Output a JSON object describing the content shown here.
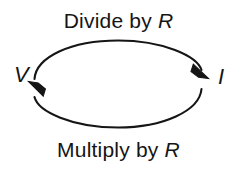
{
  "figure": {
    "name": "voltage-current-conversion-cycle",
    "background_color": "#ffffff",
    "stroke_color": "#151515",
    "text_color": "#151515"
  },
  "nodes": [
    {
      "id": "voltage",
      "label": "V",
      "italic": true,
      "position": "left"
    },
    {
      "id": "current",
      "label": "I",
      "italic": true,
      "position": "right"
    }
  ],
  "edges": [
    {
      "id": "divide",
      "label_prefix": "Divide by ",
      "label_variable": "R",
      "label_full": "Divide by R",
      "from": "V",
      "to": "I",
      "position": "top",
      "direction": "left-to-right",
      "arrowhead": "solid-triangle"
    },
    {
      "id": "multiply",
      "label_prefix": "Multiply by ",
      "label_variable": "R",
      "label_full": "Multiply by R",
      "from": "I",
      "to": "V",
      "position": "bottom",
      "direction": "right-to-left",
      "arrowhead": "solid-triangle"
    }
  ]
}
